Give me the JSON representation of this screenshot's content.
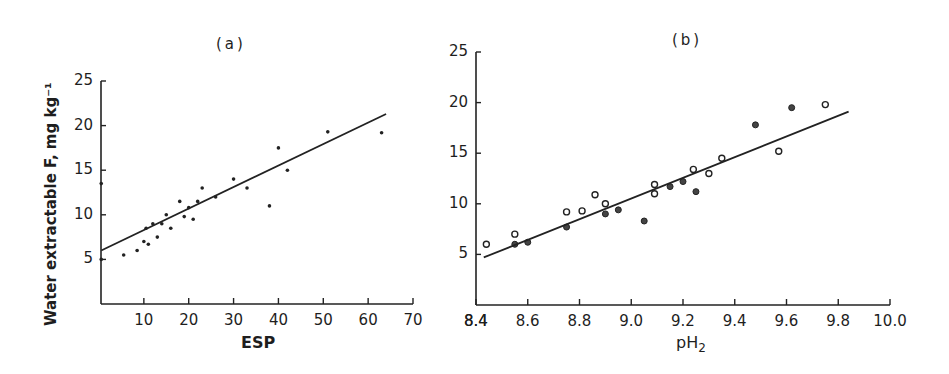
{
  "figure": {
    "ylabel": "Water extractable F, mg kg⁻¹",
    "panels": [
      {
        "id": "a",
        "title": "(a)",
        "xlabel": "ESP"
      },
      {
        "id": "b",
        "title": "(b)",
        "xlabel_main": "pH",
        "xlabel_sub": "2"
      }
    ]
  },
  "chart_data": [
    {
      "type": "scatter",
      "title": "(a)",
      "xlabel": "ESP",
      "ylabel": "Water extractable F, mg kg-1",
      "xlim": [
        0,
        70
      ],
      "ylim": [
        0,
        25
      ],
      "xticks": [
        10,
        20,
        30,
        40,
        50,
        60,
        70
      ],
      "yticks": [
        5,
        10,
        15,
        20,
        25
      ],
      "grid": false,
      "legend": null,
      "series": [
        {
          "name": "observations",
          "marker": "filled-dot",
          "points": [
            [
              0.5,
              13.5
            ],
            [
              0.5,
              5.0
            ],
            [
              5.5,
              5.5
            ],
            [
              8.5,
              6.0
            ],
            [
              10,
              7.0
            ],
            [
              10.5,
              8.5
            ],
            [
              11,
              6.7
            ],
            [
              12,
              9.0
            ],
            [
              13,
              7.5
            ],
            [
              14,
              9.0
            ],
            [
              15,
              10.0
            ],
            [
              16,
              8.5
            ],
            [
              18,
              11.5
            ],
            [
              19,
              9.8
            ],
            [
              20,
              10.8
            ],
            [
              21,
              9.5
            ],
            [
              22,
              11.5
            ],
            [
              23,
              13.0
            ],
            [
              26,
              12.0
            ],
            [
              30,
              14.0
            ],
            [
              33,
              13.0
            ],
            [
              38,
              11.0
            ],
            [
              40,
              17.5
            ],
            [
              42,
              15.0
            ],
            [
              51,
              19.3
            ],
            [
              63,
              19.2
            ]
          ]
        },
        {
          "name": "regression line",
          "type": "line",
          "points": [
            [
              0.5,
              6.0
            ],
            [
              64,
              21.3
            ]
          ]
        }
      ]
    },
    {
      "type": "scatter",
      "title": "(b)",
      "xlabel": "pH2",
      "ylabel": "Water extractable F, mg kg-1",
      "xlim": [
        8.4,
        10.0
      ],
      "ylim": [
        0,
        25
      ],
      "xticks": [
        8.4,
        8.6,
        8.8,
        9.0,
        9.2,
        9.4,
        9.6,
        9.8,
        10.0
      ],
      "yticks": [
        5,
        10,
        15,
        20,
        25
      ],
      "grid": false,
      "legend": null,
      "series": [
        {
          "name": "open circles",
          "marker": "open-circle",
          "points": [
            [
              8.44,
              6.0
            ],
            [
              8.55,
              7.0
            ],
            [
              8.75,
              9.2
            ],
            [
              8.81,
              9.3
            ],
            [
              8.86,
              10.9
            ],
            [
              8.9,
              10.0
            ],
            [
              9.09,
              11.0
            ],
            [
              9.09,
              11.9
            ],
            [
              9.24,
              13.4
            ],
            [
              9.3,
              13.0
            ],
            [
              9.35,
              14.5
            ],
            [
              9.57,
              15.2
            ],
            [
              9.75,
              19.8
            ]
          ]
        },
        {
          "name": "filled circles",
          "marker": "filled-circle",
          "points": [
            [
              8.55,
              6.0
            ],
            [
              8.6,
              6.2
            ],
            [
              8.75,
              7.7
            ],
            [
              8.9,
              9.0
            ],
            [
              8.95,
              9.4
            ],
            [
              9.05,
              8.3
            ],
            [
              9.15,
              11.7
            ],
            [
              9.2,
              12.2
            ],
            [
              9.25,
              11.2
            ],
            [
              9.48,
              17.8
            ],
            [
              9.62,
              19.5
            ]
          ]
        },
        {
          "name": "regression line",
          "type": "line",
          "points": [
            [
              8.43,
              4.7
            ],
            [
              9.84,
              19.1
            ]
          ]
        }
      ]
    }
  ]
}
